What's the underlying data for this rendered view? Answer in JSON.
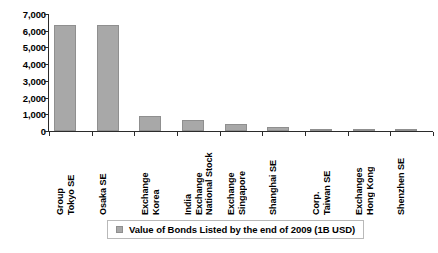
{
  "chart_data": {
    "type": "bar",
    "title": "",
    "xlabel": "",
    "ylabel": "",
    "ylim": [
      0,
      7000
    ],
    "ytick_step": 1000,
    "grid": false,
    "legend_position": "bottom",
    "bar_color": "#a8a8a8",
    "axis_color": "#2b2b2b",
    "categories": [
      "Tokyo SE Group",
      "Osaka SE",
      "Korea Exchange",
      "National Stock Exchange India",
      "Singapore Exchange",
      "Shanghai SE",
      "Taiwan SE Corp.",
      "Hong Kong Exchanges",
      "Shenzhen SE"
    ],
    "category_label_lines": [
      [
        "Tokyo SE",
        "Group"
      ],
      [
        "Osaka SE"
      ],
      [
        "Korea",
        "Exchange"
      ],
      [
        "National Stock",
        "Exchange",
        "India"
      ],
      [
        "Singapore",
        "Exchange"
      ],
      [
        "Shanghai SE"
      ],
      [
        "Taiwan SE",
        "Corp."
      ],
      [
        "Hong Kong",
        "Exchanges"
      ],
      [
        "Shenzhen SE"
      ]
    ],
    "values": [
      6350,
      6340,
      880,
      640,
      420,
      230,
      95,
      25,
      5
    ],
    "ytick_labels": [
      "7,000",
      "6,000",
      "5,000",
      "4,000",
      "3,000",
      "2,000",
      "1,000",
      "0"
    ],
    "ytick_values": [
      7000,
      6000,
      5000,
      4000,
      3000,
      2000,
      1000,
      0
    ],
    "series": [
      {
        "name": "Value of Bonds Listed by the end of 2009 (1B USD)",
        "values": [
          6350,
          6340,
          880,
          640,
          420,
          230,
          95,
          25,
          5
        ]
      }
    ]
  },
  "legend": {
    "label": "Value of Bonds Listed by the end of 2009 (1B USD)",
    "swatch_color": "#a8a8a8"
  }
}
